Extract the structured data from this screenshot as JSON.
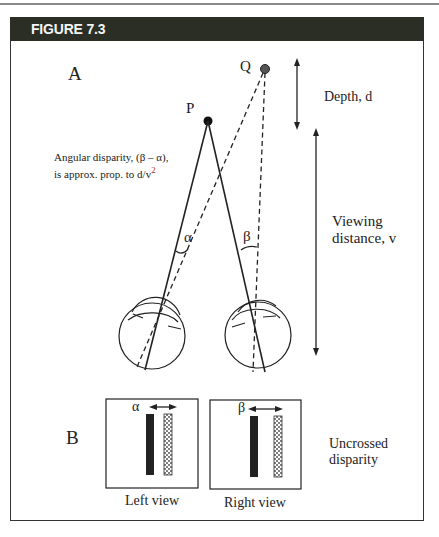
{
  "figure": {
    "title": "FIGURE 7.3",
    "panel_a": {
      "label": "A",
      "point_p": "P",
      "point_q": "Q",
      "depth_label": "Depth, d",
      "viewing_label_line1": "Viewing",
      "viewing_label_line2": "distance, v",
      "disparity_note_line1": "Angular disparity, (β – α),",
      "disparity_note_line2": "is approx. prop. to d/v",
      "disparity_note_sup": "2",
      "alpha": "α",
      "beta": "β"
    },
    "panel_b": {
      "label": "B",
      "left_view_label": "Left view",
      "right_view_label": "Right view",
      "alpha": "α",
      "beta": "β",
      "caption_line1": "Uncrossed",
      "caption_line2": "disparity"
    },
    "colors": {
      "header_bg": "#2a2e25",
      "header_text": "#f4f4f4",
      "line": "#222222"
    }
  }
}
